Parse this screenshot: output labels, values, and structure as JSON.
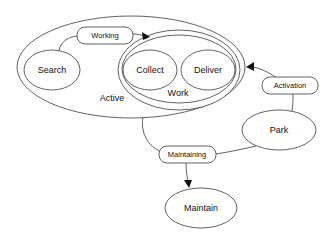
{
  "diagram": {
    "type": "state-diagram",
    "states": {
      "active": {
        "label": "Active"
      },
      "work": {
        "label": "Work"
      },
      "search": {
        "label": "Search"
      },
      "collect": {
        "label": "Collect"
      },
      "deliver": {
        "label": "Deliver"
      },
      "park": {
        "label": "Park"
      },
      "maintain": {
        "label": "Maintain"
      }
    },
    "transitions": {
      "working": {
        "label": "Working",
        "from": "Search",
        "to": "Work"
      },
      "activation": {
        "label": "Activation",
        "from": "Park",
        "to": "Active"
      },
      "maintaining": {
        "label": "Maintaining",
        "from": [
          "Active",
          "Park"
        ],
        "to": "Maintain"
      }
    },
    "colors": {
      "stroke": "#3a3a3a",
      "fill": "#ffffff",
      "text": "#111111"
    }
  }
}
